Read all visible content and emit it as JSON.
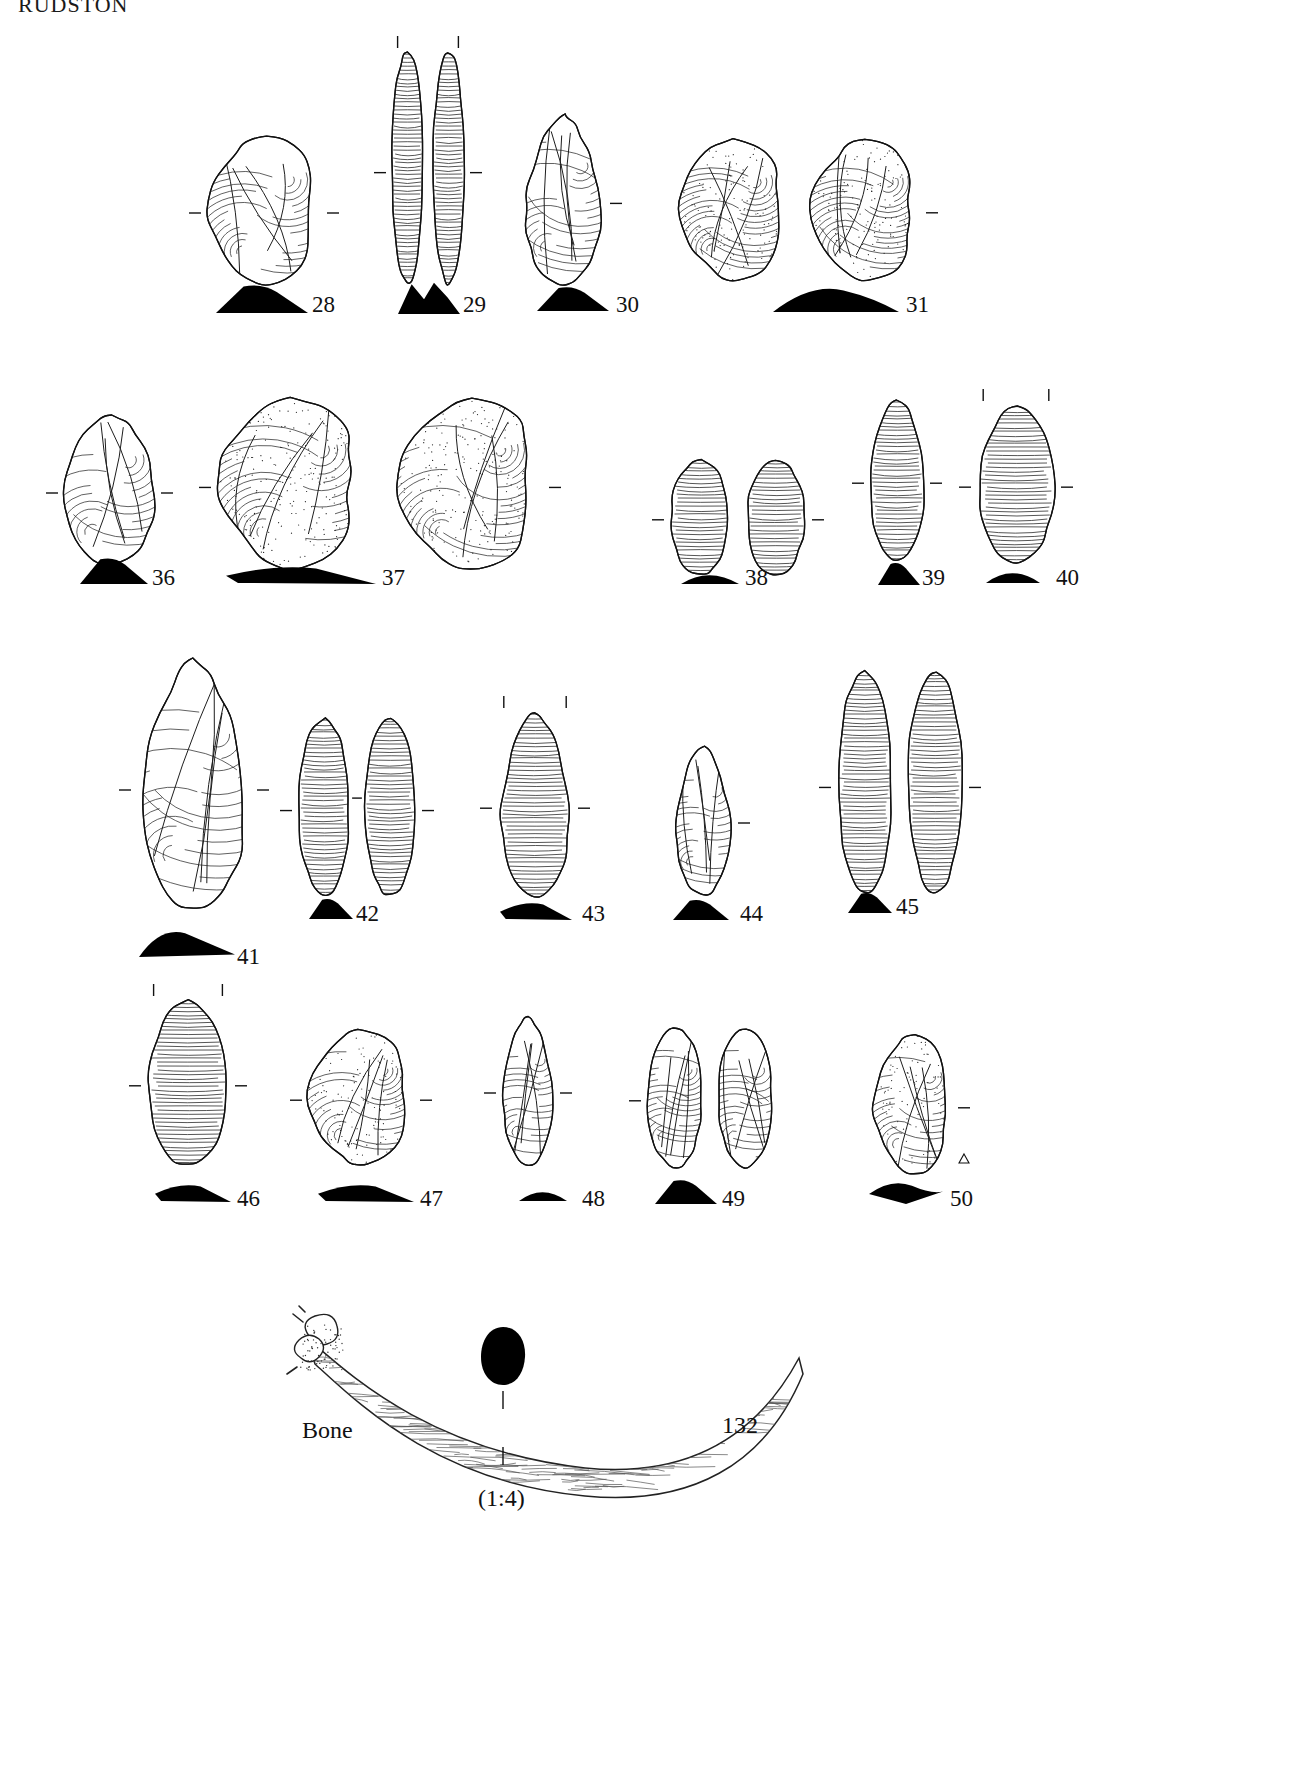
{
  "plate": {
    "title": "RUDSTON",
    "scale_note": "(1:4)",
    "bone_label": "Bone",
    "ink": "#111111",
    "paper": "#ffffff"
  },
  "rows": [
    {
      "row_name": "row-1-flakes-cores",
      "items": [
        {
          "number": "28",
          "kind": "flake-core",
          "x": 205,
          "y": 135,
          "w": 118,
          "h": 150,
          "num_x": 312,
          "num_y": 292,
          "sil_x": 216,
          "sil_y": 283,
          "sil_w": 92,
          "sil_h": 30,
          "sil_shape": "hump",
          "ticks": [
            "left-mid",
            "right-mid"
          ]
        },
        {
          "number": "29",
          "kind": "blade-flake-two-views",
          "x": 390,
          "y": 52,
          "w": 76,
          "h": 232,
          "num_x": 463,
          "num_y": 292,
          "sil_x": 398,
          "sil_y": 281,
          "sil_w": 62,
          "sil_h": 33,
          "sil_shape": "notched",
          "ticks": [
            "left-mid",
            "right-mid",
            "top-left",
            "top-right"
          ]
        },
        {
          "number": "30",
          "kind": "point",
          "x": 520,
          "y": 115,
          "w": 86,
          "h": 170,
          "num_x": 616,
          "num_y": 292,
          "sil_x": 537,
          "sil_y": 285,
          "sil_w": 72,
          "sil_h": 26,
          "sil_shape": "hump",
          "ticks": [
            "right-mid"
          ]
        },
        {
          "number": "31",
          "kind": "levallois-core-two-views",
          "x": 676,
          "y": 140,
          "w": 246,
          "h": 140,
          "num_x": 906,
          "num_y": 292,
          "sil_x": 773,
          "sil_y": 282,
          "sil_w": 126,
          "sil_h": 30,
          "sil_shape": "wide-hump",
          "ticks": [
            "right-mid"
          ]
        }
      ]
    },
    {
      "row_name": "row-2-levallois",
      "items": [
        {
          "number": "36",
          "kind": "flake-side",
          "x": 62,
          "y": 415,
          "w": 95,
          "h": 150,
          "num_x": 152,
          "num_y": 565,
          "sil_x": 80,
          "sil_y": 556,
          "sil_w": 68,
          "sil_h": 28,
          "sil_shape": "hump",
          "ticks": [
            "left-mid",
            "right-mid"
          ]
        },
        {
          "number": "37",
          "kind": "levallois-core-two-views",
          "x": 215,
          "y": 398,
          "w": 330,
          "h": 172,
          "num_x": 382,
          "num_y": 565,
          "sil_x": 226,
          "sil_y": 562,
          "sil_w": 150,
          "sil_h": 22,
          "sil_shape": "flat-wedge",
          "ticks": [
            "left-mid",
            "right-mid"
          ]
        },
        {
          "number": "38",
          "kind": "blade-pair",
          "x": 668,
          "y": 460,
          "w": 140,
          "h": 115,
          "num_x": 745,
          "num_y": 565,
          "sil_x": 681,
          "sil_y": 566,
          "sil_w": 58,
          "sil_h": 18,
          "sil_shape": "low-hump",
          "ticks": [
            "left-mid",
            "right-mid"
          ]
        },
        {
          "number": "39",
          "kind": "blade",
          "x": 868,
          "y": 400,
          "w": 58,
          "h": 160,
          "num_x": 922,
          "num_y": 565,
          "sil_x": 878,
          "sil_y": 561,
          "sil_w": 42,
          "sil_h": 24,
          "sil_shape": "hump",
          "ticks": [
            "left-mid",
            "right-mid"
          ]
        },
        {
          "number": "40",
          "kind": "blade",
          "x": 975,
          "y": 405,
          "w": 82,
          "h": 158,
          "num_x": 1056,
          "num_y": 565,
          "sil_x": 986,
          "sil_y": 563,
          "sil_w": 54,
          "sil_h": 20,
          "sil_shape": "low-hump",
          "ticks": [
            "left-mid",
            "right-mid",
            "top-left",
            "top-right"
          ]
        }
      ]
    },
    {
      "row_name": "row-3-blades",
      "items": [
        {
          "number": "41",
          "kind": "large-point",
          "x": 135,
          "y": 660,
          "w": 118,
          "h": 250,
          "num_x": 237,
          "num_y": 944,
          "sil_x": 139,
          "sil_y": 925,
          "sil_w": 96,
          "sil_h": 32,
          "sil_shape": "long-wedge",
          "ticks": [
            "left-mid",
            "right-mid"
          ]
        },
        {
          "number": "42",
          "kind": "blade-two-views",
          "x": 296,
          "y": 718,
          "w": 122,
          "h": 178,
          "num_x": 356,
          "num_y": 901,
          "sil_x": 309,
          "sil_y": 897,
          "sil_w": 44,
          "sil_h": 22,
          "sil_shape": "hump",
          "ticks": [
            "left-mid",
            "mid",
            "right-mid"
          ]
        },
        {
          "number": "43",
          "kind": "point-blade",
          "x": 496,
          "y": 712,
          "w": 78,
          "h": 185,
          "num_x": 582,
          "num_y": 901,
          "sil_x": 500,
          "sil_y": 898,
          "sil_w": 72,
          "sil_h": 22,
          "sil_shape": "flat-wedge",
          "ticks": [
            "left-mid",
            "right-mid",
            "top-left",
            "top-right"
          ]
        },
        {
          "number": "44",
          "kind": "point",
          "x": 672,
          "y": 745,
          "w": 62,
          "h": 150,
          "num_x": 740,
          "num_y": 901,
          "sil_x": 673,
          "sil_y": 898,
          "sil_w": 56,
          "sil_h": 22,
          "sil_shape": "hump",
          "ticks": [
            "right-mid"
          ]
        },
        {
          "number": "45",
          "kind": "blade-pair-long",
          "x": 835,
          "y": 672,
          "w": 130,
          "h": 222,
          "num_x": 896,
          "num_y": 894,
          "sil_x": 848,
          "sil_y": 891,
          "sil_w": 44,
          "sil_h": 22,
          "sil_shape": "hump",
          "ticks": [
            "left-mid",
            "right-mid"
          ]
        }
      ]
    },
    {
      "row_name": "row-4-tools",
      "items": [
        {
          "number": "46",
          "kind": "blade-truncated",
          "x": 145,
          "y": 1000,
          "w": 86,
          "h": 165,
          "num_x": 237,
          "num_y": 1186,
          "sil_x": 155,
          "sil_y": 1180,
          "sil_w": 76,
          "sil_h": 22,
          "sil_shape": "flat-wedge",
          "ticks": [
            "left-mid",
            "right-mid",
            "top-left",
            "top-right"
          ]
        },
        {
          "number": "47",
          "kind": "scraper",
          "x": 306,
          "y": 1030,
          "w": 110,
          "h": 135,
          "num_x": 420,
          "num_y": 1186,
          "sil_x": 318,
          "sil_y": 1180,
          "sil_w": 96,
          "sil_h": 22,
          "sil_shape": "flat-wedge",
          "ticks": [
            "left-mid",
            "right-mid"
          ]
        },
        {
          "number": "48",
          "kind": "point-narrow",
          "x": 500,
          "y": 1015,
          "w": 56,
          "h": 150,
          "num_x": 582,
          "num_y": 1186,
          "sil_x": 519,
          "sil_y": 1183,
          "sil_w": 48,
          "sil_h": 18,
          "sil_shape": "low-hump",
          "ticks": [
            "left-mid",
            "right-mid"
          ]
        },
        {
          "number": "49",
          "kind": "leaf-point-two-views",
          "x": 645,
          "y": 1028,
          "w": 130,
          "h": 140,
          "num_x": 722,
          "num_y": 1186,
          "sil_x": 655,
          "sil_y": 1178,
          "sil_w": 62,
          "sil_h": 26,
          "sil_shape": "hump",
          "ticks": [
            "left-mid"
          ]
        },
        {
          "number": "50",
          "kind": "scraper-flake",
          "x": 872,
          "y": 1035,
          "w": 82,
          "h": 140,
          "num_x": 950,
          "num_y": 1186,
          "sil_x": 869,
          "sil_y": 1178,
          "sil_w": 74,
          "sil_h": 26,
          "sil_shape": "diamond",
          "ticks": [
            "right-mid"
          ]
        }
      ]
    }
  ],
  "bone": {
    "number": "132",
    "label": "Bone",
    "scale": "(1:4)",
    "x": 285,
    "y": 1300,
    "w": 520,
    "h": 210,
    "label_x": 302,
    "label_y": 1417,
    "number_x": 722,
    "number_y": 1412,
    "scale_x": 478,
    "scale_y": 1485,
    "section_x": 478,
    "section_y": 1325
  }
}
